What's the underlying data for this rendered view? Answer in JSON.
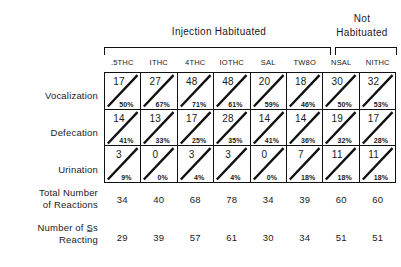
{
  "header": {
    "group_injection": "Injection  Habituated",
    "group_not_habituated_line1": "Not",
    "group_not_habituated_line2": "Habituated"
  },
  "columns": [
    {
      "label": ".5THC"
    },
    {
      "label": "ITHC"
    },
    {
      "label": "4THC"
    },
    {
      "label": "IOTHC"
    },
    {
      "label": "SAL"
    },
    {
      "label": "TW8O"
    },
    {
      "label": "NSAL"
    },
    {
      "label": "NITHC"
    }
  ],
  "rows": [
    {
      "label": "Vocalization",
      "counts": [
        "17",
        "27",
        "48",
        "48",
        "20",
        "18",
        "30",
        "32"
      ],
      "percents": [
        "50%",
        "67%",
        "71%",
        "61%",
        "59%",
        "46%",
        "50%",
        "53%"
      ]
    },
    {
      "label": "Defecation",
      "counts": [
        "14",
        "13",
        "17",
        "28",
        "14",
        "14",
        "19",
        "17"
      ],
      "percents": [
        "41%",
        "33%",
        "25%",
        "35%",
        "41%",
        "36%",
        "32%",
        "28%"
      ]
    },
    {
      "label": "Urination",
      "counts": [
        "3",
        "0",
        "3",
        "3",
        "0",
        "7",
        "11",
        "11"
      ],
      "percents": [
        "9%",
        "0%",
        "4%",
        "4%",
        "0%",
        "18%",
        "18%",
        "18%"
      ]
    }
  ],
  "summary": [
    {
      "label_line1": "Total  Number",
      "label_line2": "of  Reactions",
      "values": [
        "34",
        "40",
        "68",
        "78",
        "34",
        "39",
        "60",
        "60"
      ]
    },
    {
      "label_line1": "Number  of  S̲s",
      "label_line2": "Reacting",
      "values": [
        "29",
        "39",
        "57",
        "61",
        "30",
        "34",
        "51",
        "51"
      ]
    }
  ],
  "colors": {
    "ink": "#1a1a1a",
    "rule": "#111111",
    "background": "#ffffff"
  }
}
